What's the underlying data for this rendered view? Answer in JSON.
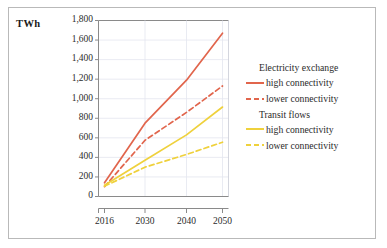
{
  "chart_data": {
    "type": "line",
    "title": "",
    "ylabel": "TWh",
    "xlabel": "",
    "ylim": [
      0,
      1800
    ],
    "ytick_step": 200,
    "grid": true,
    "legend_position": "right",
    "x": [
      2016,
      2030,
      2040,
      2050
    ],
    "xtick_labels": [
      "2016",
      "2030",
      "2040",
      "2050"
    ],
    "ytick_labels": [
      "0",
      "200",
      "400",
      "600",
      "800",
      "1,000",
      "1,200",
      "1,400",
      "1,600",
      "1,800"
    ],
    "legend_groups": [
      {
        "heading": "Electricity exchange",
        "entries": [
          {
            "label": "high connectivity",
            "style": "solid",
            "color": "#e1654c"
          },
          {
            "label": "lower connectivity",
            "style": "dashed",
            "color": "#e1654c"
          }
        ]
      },
      {
        "heading": "Transit flows",
        "entries": [
          {
            "label": "high connectivity",
            "style": "solid",
            "color": "#efd13c"
          },
          {
            "label": "lower connectivity",
            "style": "dashed",
            "color": "#efd13c"
          }
        ]
      }
    ],
    "series": [
      {
        "name": "Electricity exchange - high connectivity",
        "group": "Electricity exchange",
        "style": "solid",
        "color": "#e1654c",
        "values": [
          140,
          750,
          1190,
          1670
        ]
      },
      {
        "name": "Electricity exchange - lower connectivity",
        "group": "Electricity exchange",
        "style": "dashed",
        "color": "#e1654c",
        "values": [
          100,
          575,
          860,
          1130
        ]
      },
      {
        "name": "Transit flows - high connectivity",
        "group": "Transit flows",
        "style": "solid",
        "color": "#efd13c",
        "values": [
          115,
          370,
          630,
          915
        ]
      },
      {
        "name": "Transit flows - lower connectivity",
        "group": "Transit flows",
        "style": "dashed",
        "color": "#efd13c",
        "values": [
          105,
          300,
          430,
          555
        ]
      }
    ]
  }
}
